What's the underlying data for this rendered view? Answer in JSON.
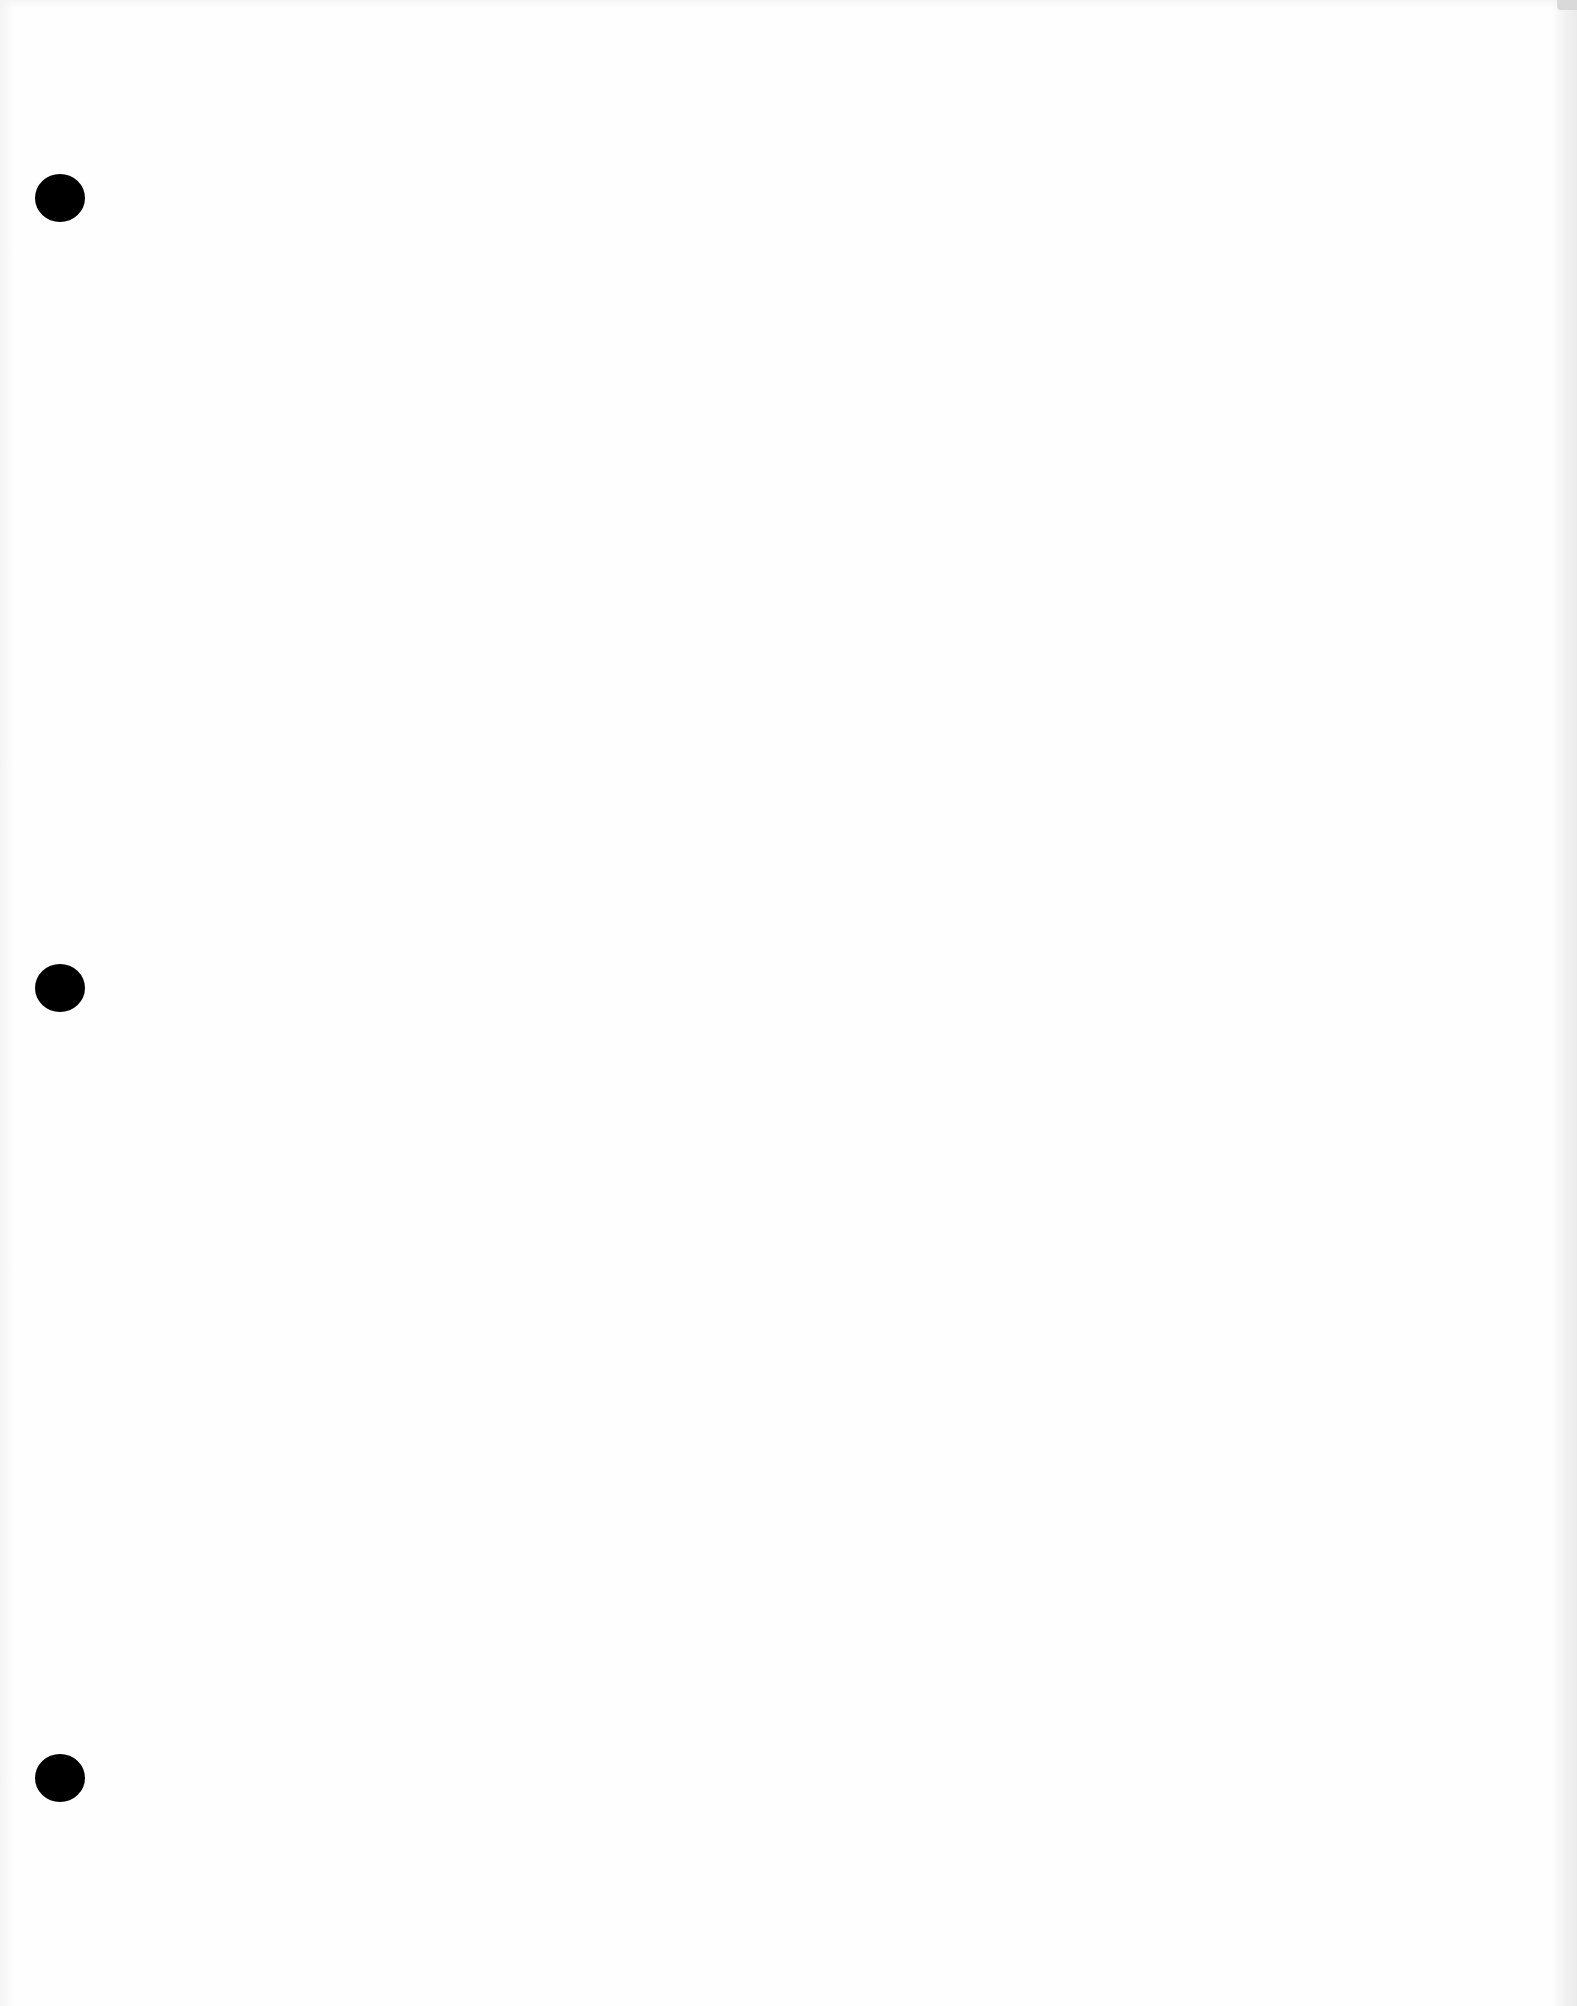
{
  "document": {
    "type": "blank-page",
    "background_color": "#fefefe",
    "edge_shading_color": "#ebebeb",
    "punch_holes": [
      {
        "cx": 60,
        "cy": 198,
        "w": 50,
        "h": 48
      },
      {
        "cx": 60,
        "cy": 988,
        "w": 50,
        "h": 48
      },
      {
        "cx": 60,
        "cy": 1778,
        "w": 50,
        "h": 48
      }
    ],
    "punch_hole_color": "#000000"
  }
}
